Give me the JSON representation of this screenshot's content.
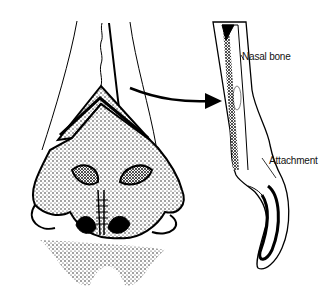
{
  "figure": {
    "type": "anatomical-illustration",
    "colors": {
      "ink": "#000000",
      "background": "#ffffff"
    }
  },
  "labels": {
    "nasal_bone": "Nasal bone",
    "attachment": "Attachment"
  }
}
